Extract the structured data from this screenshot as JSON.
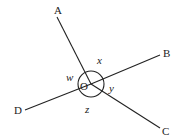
{
  "diagram": {
    "type": "intersecting-lines-angles",
    "vertex": {
      "label": "O",
      "x": 91,
      "y": 84
    },
    "rays": [
      {
        "name": "OA",
        "label": "A",
        "end": {
          "x": 57,
          "y": 17
        },
        "label_pos": {
          "x": 54,
          "y": 14
        }
      },
      {
        "name": "OB",
        "label": "B",
        "end": {
          "x": 160,
          "y": 55
        },
        "label_pos": {
          "x": 163,
          "y": 57
        }
      },
      {
        "name": "OC",
        "label": "C",
        "end": {
          "x": 160,
          "y": 128
        },
        "label_pos": {
          "x": 162,
          "y": 135
        }
      },
      {
        "name": "OD",
        "label": "D",
        "end": {
          "x": 25,
          "y": 110
        },
        "label_pos": {
          "x": 14,
          "y": 114
        }
      }
    ],
    "angles": [
      {
        "label": "x",
        "between": "A-B",
        "label_pos": {
          "x": 97,
          "y": 64
        }
      },
      {
        "label": "y",
        "between": "B-C",
        "label_pos": {
          "x": 109,
          "y": 92
        }
      },
      {
        "label": "z",
        "between": "C-D",
        "label_pos": {
          "x": 85,
          "y": 113
        }
      },
      {
        "label": "w",
        "between": "D-A",
        "label_pos": {
          "x": 66,
          "y": 81
        }
      }
    ],
    "arc_radius": 13,
    "stroke_color": "#222222"
  }
}
